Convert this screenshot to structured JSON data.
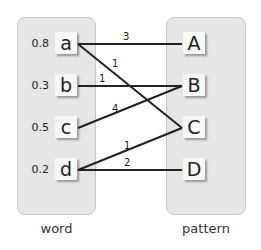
{
  "left_group": {
    "label": "word",
    "nodes": [
      {
        "id": "a",
        "label": "a",
        "weight": "0.8"
      },
      {
        "id": "b",
        "label": "b",
        "weight": "0.3"
      },
      {
        "id": "c",
        "label": "c",
        "weight": "0.5"
      },
      {
        "id": "d",
        "label": "d",
        "weight": "0.2"
      }
    ]
  },
  "right_group": {
    "label": "pattern",
    "nodes": [
      {
        "id": "A",
        "label": "A"
      },
      {
        "id": "B",
        "label": "B"
      },
      {
        "id": "C",
        "label": "C"
      },
      {
        "id": "D",
        "label": "D"
      }
    ]
  },
  "edges": [
    {
      "from": "a",
      "to": "A",
      "label": "3"
    },
    {
      "from": "a",
      "to": "C",
      "label": "1"
    },
    {
      "from": "b",
      "to": "B",
      "label": "1"
    },
    {
      "from": "c",
      "to": "B",
      "label": "4"
    },
    {
      "from": "d",
      "to": "C",
      "label": "1"
    },
    {
      "from": "d",
      "to": "D",
      "label": "2"
    }
  ],
  "colors": {
    "panel": "#e6e6e6",
    "node": "#f7f7f7",
    "line": "#222222"
  }
}
